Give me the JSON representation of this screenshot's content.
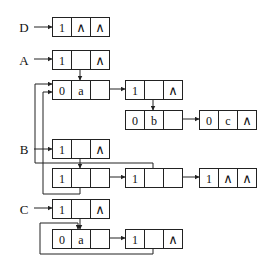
{
  "diagram": {
    "type": "generalized-list-storage-structure",
    "colors": {
      "stroke": "#222222",
      "background": "#ffffff",
      "text": "#111111"
    },
    "labels": [
      {
        "id": "D",
        "text": "D",
        "x": 24,
        "y": 27
      },
      {
        "id": "A",
        "text": "A",
        "x": 24,
        "y": 60
      },
      {
        "id": "B",
        "text": "B",
        "x": 24,
        "y": 149
      },
      {
        "id": "C",
        "text": "C",
        "x": 24,
        "y": 209
      }
    ],
    "nodes": [
      {
        "id": "D1",
        "x": 52,
        "y": 17,
        "cells": [
          "1",
          "∧",
          "∧"
        ]
      },
      {
        "id": "A1",
        "x": 52,
        "y": 50,
        "cells": [
          "1",
          "",
          "∧"
        ]
      },
      {
        "id": "Aa",
        "x": 52,
        "y": 80,
        "cells": [
          "0",
          "a",
          ""
        ]
      },
      {
        "id": "A2",
        "x": 125,
        "y": 80,
        "cells": [
          "1",
          "",
          "∧"
        ]
      },
      {
        "id": "Ab",
        "x": 125,
        "y": 110,
        "cells": [
          "0",
          "b",
          ""
        ]
      },
      {
        "id": "Ac",
        "x": 199,
        "y": 110,
        "cells": [
          "0",
          "c",
          "∧"
        ]
      },
      {
        "id": "B1",
        "x": 52,
        "y": 139,
        "cells": [
          "1",
          "",
          "∧"
        ]
      },
      {
        "id": "B2",
        "x": 52,
        "y": 168,
        "cells": [
          "1",
          "",
          ""
        ]
      },
      {
        "id": "B3",
        "x": 125,
        "y": 168,
        "cells": [
          "1",
          "",
          ""
        ]
      },
      {
        "id": "B4",
        "x": 199,
        "y": 168,
        "cells": [
          "1",
          "∧",
          "∧"
        ]
      },
      {
        "id": "C1",
        "x": 52,
        "y": 199,
        "cells": [
          "1",
          "",
          "∧"
        ]
      },
      {
        "id": "Ca",
        "x": 52,
        "y": 229,
        "cells": [
          "0",
          "a",
          ""
        ]
      },
      {
        "id": "C2",
        "x": 125,
        "y": 229,
        "cells": [
          "1",
          "",
          "∧"
        ]
      }
    ],
    "edges": [
      {
        "from": "label-D",
        "to": "D1",
        "points": [
          [
            34,
            27
          ],
          [
            52,
            27
          ]
        ],
        "arrow": true
      },
      {
        "from": "label-A",
        "to": "A1",
        "points": [
          [
            34,
            59
          ],
          [
            52,
            59
          ]
        ],
        "arrow": true
      },
      {
        "from": "A1.hp",
        "to": "Aa",
        "points": [
          [
            80,
            59
          ],
          [
            80,
            80
          ]
        ],
        "arrow": true
      },
      {
        "from": "Aa.tp",
        "to": "A2",
        "points": [
          [
            99,
            89
          ],
          [
            125,
            89
          ]
        ],
        "arrow": true
      },
      {
        "from": "A2.hp",
        "to": "Ab",
        "points": [
          [
            153,
            89
          ],
          [
            153,
            110
          ]
        ],
        "arrow": true
      },
      {
        "from": "Ab.tp",
        "to": "Ac",
        "points": [
          [
            172,
            119
          ],
          [
            199,
            119
          ]
        ],
        "arrow": true
      },
      {
        "from": "label-B",
        "to": "B1",
        "points": [
          [
            34,
            149
          ],
          [
            52,
            149
          ]
        ],
        "arrow": true
      },
      {
        "from": "B1.hp",
        "to": "B2",
        "points": [
          [
            80,
            148
          ],
          [
            80,
            168
          ]
        ],
        "arrow": true
      },
      {
        "from": "B2.tp",
        "to": "B3",
        "points": [
          [
            99,
            177
          ],
          [
            125,
            177
          ]
        ],
        "arrow": true
      },
      {
        "from": "B3.tp",
        "to": "B4",
        "points": [
          [
            172,
            177
          ],
          [
            199,
            177
          ]
        ],
        "arrow": true
      },
      {
        "from": "B3.hp",
        "to": "Aa",
        "points": [
          [
            153,
            177
          ],
          [
            153,
            163
          ],
          [
            35,
            163
          ],
          [
            35,
            84
          ],
          [
            52,
            84
          ]
        ],
        "arrow": true
      },
      {
        "from": "B2.hp",
        "to": "Aa",
        "points": [
          [
            80,
            177
          ],
          [
            80,
            194
          ],
          [
            43,
            194
          ],
          [
            43,
            92
          ],
          [
            52,
            92
          ]
        ],
        "arrow": true
      },
      {
        "from": "label-C",
        "to": "C1",
        "points": [
          [
            34,
            208
          ],
          [
            52,
            208
          ]
        ],
        "arrow": true
      },
      {
        "from": "Ca.tp",
        "to": "C2",
        "points": [
          [
            99,
            238
          ],
          [
            125,
            238
          ]
        ],
        "arrow": true
      },
      {
        "from": "C1.hp",
        "to": "Ca",
        "points": [
          [
            80,
            208
          ],
          [
            80,
            229
          ]
        ],
        "arrow": true
      },
      {
        "from": "C2.hp",
        "to": "Ca",
        "points": [
          [
            153,
            238
          ],
          [
            153,
            254
          ],
          [
            40,
            254
          ],
          [
            40,
            223
          ],
          [
            78,
            223
          ],
          [
            78,
            229
          ]
        ],
        "arrow": true
      }
    ],
    "cell_width": 19,
    "cell_height": 19
  }
}
